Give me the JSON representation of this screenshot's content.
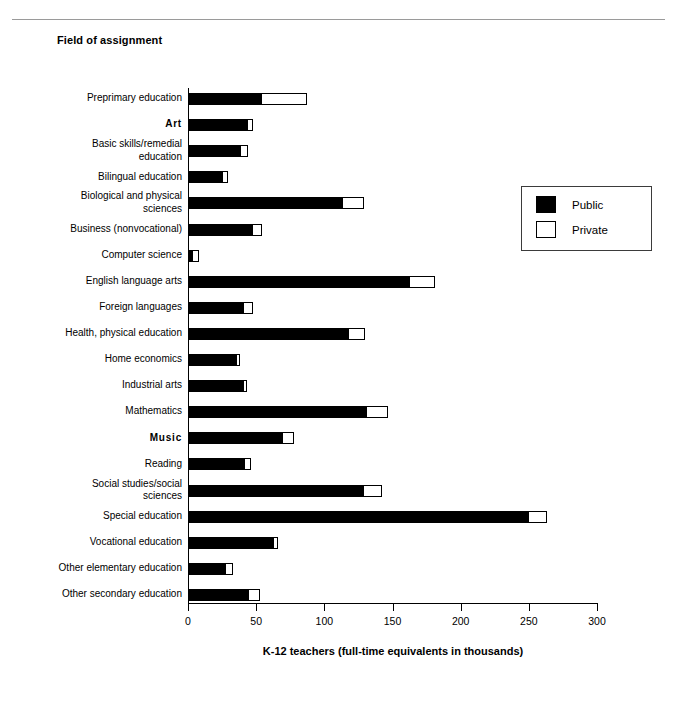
{
  "page": {
    "title": "Field of assignment",
    "top_rule": true
  },
  "legend": {
    "position": "top-right",
    "entries": [
      {
        "label": "Public",
        "swatch": "solid",
        "color": "#000000"
      },
      {
        "label": "Private",
        "swatch": "hollow",
        "color": "#ffffff"
      }
    ]
  },
  "chart_data": {
    "type": "bar",
    "orientation": "horizontal",
    "stacked": true,
    "title": "Field of assignment",
    "xlabel": "K-12 teachers (full-time equivalents in thousands)",
    "ylabel": "",
    "xlim": [
      0,
      300
    ],
    "xticks": [
      0,
      50,
      100,
      150,
      200,
      250,
      300
    ],
    "grid": false,
    "legend": [
      "Public",
      "Private"
    ],
    "categories": [
      "Preprimary education",
      "Art",
      "Basic skills/remedial\neducation",
      "Bilingual education",
      "Biological and physical\nsciences",
      "Business (nonvocational)",
      "Computer science",
      "English language arts",
      "Foreign languages",
      "Health, physical education",
      "Home economics",
      "Industrial arts",
      "Mathematics",
      "Music",
      "Reading",
      "Social studies/social\nsciences",
      "Special education",
      "Vocational education",
      "Other elementary education",
      "Other secondary education"
    ],
    "category_bold": [
      false,
      true,
      false,
      false,
      false,
      false,
      false,
      false,
      false,
      false,
      false,
      false,
      false,
      true,
      false,
      false,
      false,
      false,
      false,
      false
    ],
    "series": [
      {
        "name": "Public",
        "values": [
          54,
          44,
          39,
          26,
          114,
          48,
          4,
          163,
          41,
          118,
          36,
          41,
          131,
          70,
          42,
          129,
          250,
          63,
          28,
          45
        ]
      },
      {
        "name": "Private",
        "values": [
          33,
          4,
          5,
          3,
          15,
          6,
          4,
          18,
          7,
          12,
          2,
          2,
          16,
          8,
          4,
          13,
          13,
          3,
          5,
          8
        ]
      }
    ],
    "totals": [
      87,
      48,
      44,
      29,
      129,
      54,
      8,
      181,
      48,
      130,
      38,
      43,
      147,
      78,
      46,
      142,
      263,
      66,
      33,
      53
    ]
  }
}
